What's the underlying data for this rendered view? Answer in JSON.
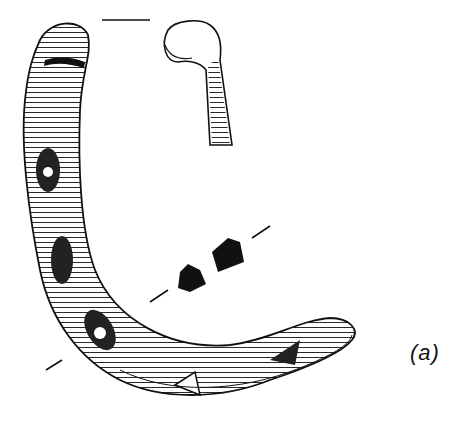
{
  "figure": {
    "panel_label": "(a)",
    "colors": {
      "ink": "#111111",
      "background": "#ffffff"
    }
  }
}
